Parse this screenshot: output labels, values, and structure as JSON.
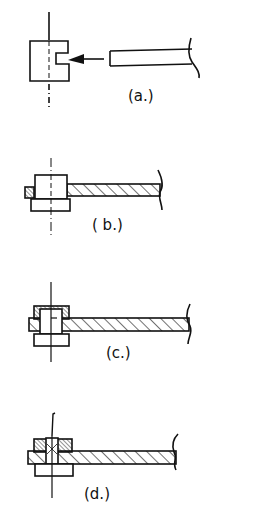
{
  "figure": {
    "panels": [
      {
        "id": "a",
        "label": "(a.)"
      },
      {
        "id": "b",
        "label": "( b.)"
      },
      {
        "id": "c",
        "label": "(c.)"
      },
      {
        "id": "d",
        "label": "(d.)"
      }
    ]
  },
  "colors": {
    "ink": "#111111",
    "background": "#ffffff"
  }
}
